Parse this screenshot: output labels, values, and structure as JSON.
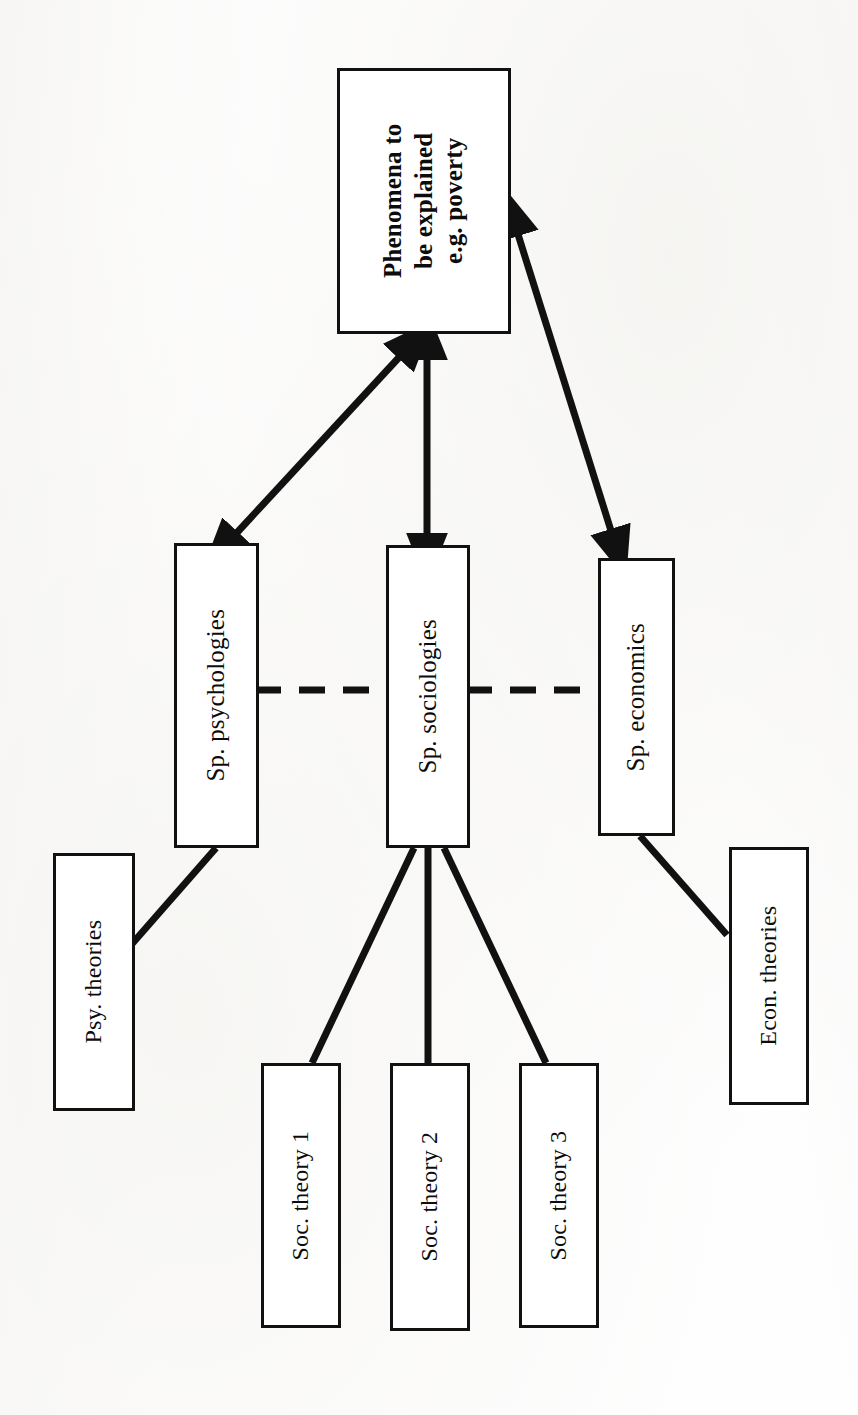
{
  "diagram": {
    "stroke_color": "#111111",
    "background_color": "#ffffff",
    "nodes": {
      "phenomena": {
        "label": "Phenomena to be explained e.g. poverty",
        "line1": "Phenomena to",
        "line2": "be explained",
        "line3": "e.g. poverty"
      },
      "sp_psychologies": {
        "label": "Sp. psychologies"
      },
      "sp_sociologies": {
        "label": "Sp. sociologies"
      },
      "sp_economics": {
        "label": "Sp. economics"
      },
      "psy_theories": {
        "label": "Psy. theories"
      },
      "econ_theories": {
        "label": "Econ. theories"
      },
      "soc_theory_1": {
        "label": "Soc. theory 1"
      },
      "soc_theory_2": {
        "label": "Soc. theory 2"
      },
      "soc_theory_3": {
        "label": "Soc. theory 3"
      }
    },
    "connectors": [
      {
        "id": "phenomena-psychologies",
        "from": "phenomena",
        "to": "sp_psychologies",
        "style": "solid",
        "arrows": "both"
      },
      {
        "id": "phenomena-sociologies",
        "from": "phenomena",
        "to": "sp_sociologies",
        "style": "solid",
        "arrows": "both"
      },
      {
        "id": "phenomena-economics",
        "from": "phenomena",
        "to": "sp_economics",
        "style": "solid",
        "arrows": "both"
      },
      {
        "id": "psychologies-sociologies",
        "from": "sp_psychologies",
        "to": "sp_sociologies",
        "style": "dashed",
        "arrows": "none"
      },
      {
        "id": "sociologies-economics",
        "from": "sp_sociologies",
        "to": "sp_economics",
        "style": "dashed",
        "arrows": "none"
      },
      {
        "id": "psychologies-psytheories",
        "from": "sp_psychologies",
        "to": "psy_theories",
        "style": "solid",
        "arrows": "none"
      },
      {
        "id": "sociologies-soctheory1",
        "from": "sp_sociologies",
        "to": "soc_theory_1",
        "style": "solid",
        "arrows": "none"
      },
      {
        "id": "sociologies-soctheory2",
        "from": "sp_sociologies",
        "to": "soc_theory_2",
        "style": "solid",
        "arrows": "none"
      },
      {
        "id": "sociologies-soctheory3",
        "from": "sp_sociologies",
        "to": "soc_theory_3",
        "style": "solid",
        "arrows": "none"
      },
      {
        "id": "economics-econtheories",
        "from": "sp_economics",
        "to": "econ_theories",
        "style": "solid",
        "arrows": "none"
      }
    ]
  }
}
